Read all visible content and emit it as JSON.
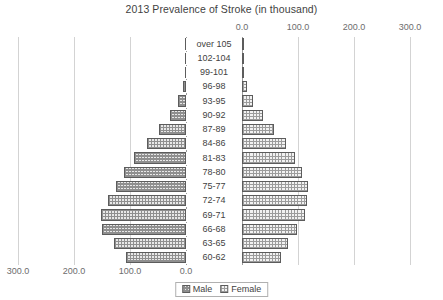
{
  "chart_data": {
    "type": "bar",
    "subtype": "population-pyramid",
    "title": "2013 Prevalence of Stroke (in thousand)",
    "xlabel": "",
    "ylabel": "",
    "grid": true,
    "legend_position": "bottom",
    "axis_left": {
      "ticks": [
        "300.0",
        "200.0",
        "100.0",
        "0.0"
      ],
      "tick_values": [
        300,
        200,
        100,
        0
      ],
      "position": "bottom",
      "direction": "reversed"
    },
    "axis_right": {
      "ticks": [
        "0.0",
        "100.0",
        "200.0",
        "300.0"
      ],
      "tick_values": [
        0,
        100,
        200,
        300
      ],
      "position": "top",
      "direction": "normal"
    },
    "xlim": [
      0,
      300
    ],
    "categories": [
      "over 105",
      "102-104",
      "99-101",
      "96-98",
      "93-95",
      "90-92",
      "87-89",
      "84-86",
      "81-83",
      "78-80",
      "75-77",
      "72-74",
      "69-71",
      "66-68",
      "63-65",
      "60-62"
    ],
    "series": [
      {
        "name": "Male",
        "side": "left",
        "values": [
          0.4,
          1.0,
          2.5,
          6.0,
          14.0,
          28.0,
          48.0,
          70.0,
          92.0,
          110.0,
          125.0,
          140.0,
          152.0,
          150.0,
          128.0,
          108.0
        ]
      },
      {
        "name": "Female",
        "side": "right",
        "values": [
          0.6,
          1.5,
          4.0,
          9.0,
          20.0,
          38.0,
          58.0,
          78.0,
          95.0,
          108.0,
          118.0,
          116.0,
          112.0,
          98.0,
          82.0,
          70.0
        ]
      }
    ]
  },
  "legend": {
    "items": [
      {
        "label": "Male",
        "swatch": "male-pattern-swatch"
      },
      {
        "label": "Female",
        "swatch": "female-pattern-swatch"
      }
    ]
  }
}
